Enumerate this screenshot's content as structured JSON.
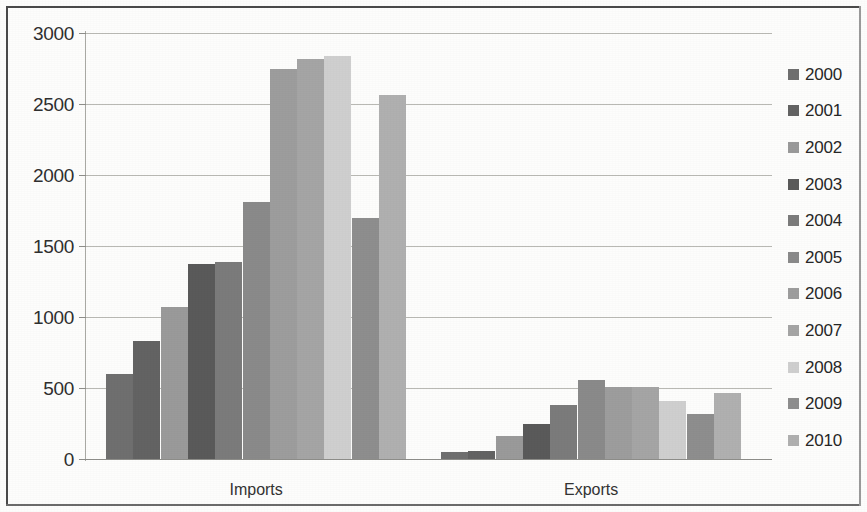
{
  "chart_data": {
    "type": "bar",
    "title": "",
    "xlabel": "",
    "ylabel": "",
    "categories": [
      "Imports",
      "Exports"
    ],
    "ylim": [
      0,
      3000
    ],
    "yticks": [
      0,
      500,
      1000,
      1500,
      2000,
      2500,
      3000
    ],
    "grid": true,
    "legend_position": "right",
    "series": [
      {
        "name": "2000",
        "color": "#6f6f6f",
        "values": [
          600,
          50
        ]
      },
      {
        "name": "2001",
        "color": "#636363",
        "values": [
          830,
          55
        ]
      },
      {
        "name": "2002",
        "color": "#9a9a9a",
        "values": [
          1070,
          165
        ]
      },
      {
        "name": "2003",
        "color": "#5a5a5a",
        "values": [
          1370,
          245
        ]
      },
      {
        "name": "2004",
        "color": "#7b7b7b",
        "values": [
          1390,
          380
        ]
      },
      {
        "name": "2005",
        "color": "#8a8a8a",
        "values": [
          1810,
          555
        ]
      },
      {
        "name": "2006",
        "color": "#9d9d9d",
        "values": [
          2750,
          505
        ]
      },
      {
        "name": "2007",
        "color": "#a5a5a5",
        "values": [
          2820,
          510
        ]
      },
      {
        "name": "2008",
        "color": "#cfcfcf",
        "values": [
          2840,
          405
        ]
      },
      {
        "name": "2009",
        "color": "#8e8e8e",
        "values": [
          1700,
          320
        ]
      },
      {
        "name": "2010",
        "color": "#b0b0b0",
        "values": [
          2560,
          465
        ]
      }
    ]
  },
  "axis": {
    "y_tick_labels": [
      "3000",
      "2500",
      "2000",
      "1500",
      "1000",
      "500",
      "0"
    ],
    "x_tick_labels": [
      "Imports",
      "Exports"
    ]
  },
  "legend": {
    "items": [
      {
        "label": "2000"
      },
      {
        "label": "2001"
      },
      {
        "label": "2002"
      },
      {
        "label": "2003"
      },
      {
        "label": "2004"
      },
      {
        "label": "2005"
      },
      {
        "label": "2006"
      },
      {
        "label": "2007"
      },
      {
        "label": "2008"
      },
      {
        "label": "2009"
      },
      {
        "label": "2010"
      }
    ]
  }
}
